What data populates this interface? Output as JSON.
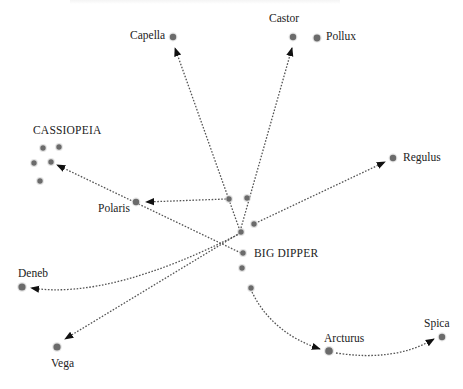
{
  "diagram": {
    "title_cropped": "",
    "colors": {
      "star": "#6b6b6b",
      "line": "#555555",
      "arrow": "#111111",
      "text": "#222222",
      "background": "#ffffff"
    },
    "stars": [
      {
        "id": "capella",
        "label": "Capella",
        "x": 173,
        "y": 37,
        "r": 3.2,
        "label_x": 130,
        "label_y": 30
      },
      {
        "id": "castor",
        "label": "Castor",
        "x": 293,
        "y": 37,
        "r": 3.2,
        "label_x": 269,
        "label_y": 13
      },
      {
        "id": "pollux",
        "label": "Pollux",
        "x": 317,
        "y": 38,
        "r": 3.4,
        "label_x": 326,
        "label_y": 31
      },
      {
        "id": "regulus",
        "label": "Regulus",
        "x": 393,
        "y": 158,
        "r": 3.2,
        "label_x": 403,
        "label_y": 152
      },
      {
        "id": "polaris",
        "label": "Polaris",
        "x": 136,
        "y": 202,
        "r": 3.2,
        "label_x": 98,
        "label_y": 203
      },
      {
        "id": "deneb",
        "label": "Deneb",
        "x": 22,
        "y": 287,
        "r": 3.6,
        "label_x": 18,
        "label_y": 268
      },
      {
        "id": "vega",
        "label": "Vega",
        "x": 57,
        "y": 347,
        "r": 3.6,
        "label_x": 51,
        "label_y": 358
      },
      {
        "id": "arcturus",
        "label": "Arcturus",
        "x": 329,
        "y": 351,
        "r": 3.8,
        "label_x": 324,
        "label_y": 333
      },
      {
        "id": "spica",
        "label": "Spica",
        "x": 442,
        "y": 337,
        "r": 3.2,
        "label_x": 424,
        "label_y": 318
      }
    ],
    "constellations": [
      {
        "id": "cassiopeia",
        "label": "CASSIOPEIA",
        "label_x": 33,
        "label_y": 125,
        "stars": [
          [
            43,
            148
          ],
          [
            59,
            147
          ],
          [
            34,
            163
          ],
          [
            51,
            162
          ],
          [
            40,
            181
          ]
        ]
      },
      {
        "id": "big-dipper",
        "label": "BIG DIPPER",
        "label_x": 254,
        "label_y": 248,
        "stars": [
          [
            229,
            199
          ],
          [
            247,
            198
          ],
          [
            254,
            224
          ],
          [
            241,
            232
          ],
          [
            243,
            253
          ],
          [
            242,
            268
          ],
          [
            251,
            288
          ]
        ]
      }
    ],
    "pointers": [
      {
        "id": "to-capella",
        "from": [
          239,
          228
        ],
        "to": [
          175,
          48
        ],
        "curve": 0
      },
      {
        "id": "to-castor",
        "from": [
          241,
          228
        ],
        "to": [
          292,
          48
        ],
        "curve": 0
      },
      {
        "id": "to-polaris",
        "from": [
          226,
          199
        ],
        "to": [
          146,
          202
        ],
        "curve": 0
      },
      {
        "id": "to-cassiopeia",
        "from": [
          241,
          253
        ],
        "to": [
          57,
          165
        ],
        "curve": 0
      },
      {
        "id": "to-regulus",
        "from": [
          258,
          222
        ],
        "to": [
          385,
          162
        ],
        "curve": 0
      },
      {
        "id": "to-deneb",
        "from": [
          241,
          233
        ],
        "to": [
          31,
          288
        ],
        "curve": 1,
        "ctrl": [
          110,
          300
        ]
      },
      {
        "id": "to-vega",
        "from": [
          240,
          233
        ],
        "to": [
          65,
          339
        ],
        "curve": 0
      },
      {
        "id": "to-arcturus",
        "from": [
          252,
          292
        ],
        "to": [
          320,
          349
        ],
        "curve": 1,
        "ctrl": [
          272,
          333
        ]
      },
      {
        "id": "to-spica",
        "from": [
          336,
          353
        ],
        "to": [
          434,
          339
        ],
        "curve": 1,
        "ctrl": [
          395,
          362
        ]
      }
    ]
  }
}
